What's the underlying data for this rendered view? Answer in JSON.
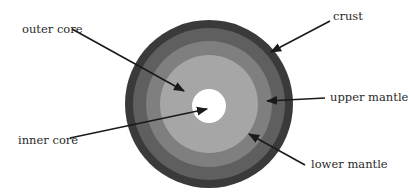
{
  "diagram": {
    "type": "concentric-layers",
    "center": [
      209,
      104
    ],
    "layers": [
      {
        "name": "crust",
        "outer_radius": 84,
        "color": "#3a3a3a"
      },
      {
        "name": "upper mantle",
        "outer_radius": 76,
        "color": "#5f5f5f"
      },
      {
        "name": "lower mantle",
        "outer_radius": 63,
        "color": "#7f7f7f"
      },
      {
        "name": "outer core",
        "outer_radius": 49,
        "color": "#a6a6a6"
      },
      {
        "name": "inner core",
        "outer_radius": 17,
        "color": "#ffffff"
      }
    ]
  },
  "labels": {
    "outer_core": "outer core",
    "inner_core": "inner core",
    "crust": "crust",
    "upper_mantle": "upper mantle",
    "lower_mantle": "lower mantle"
  },
  "arrows": [
    {
      "label": "outer core",
      "from": [
        72,
        29
      ],
      "to": [
        184,
        91
      ]
    },
    {
      "label": "inner core",
      "from": [
        70,
        138
      ],
      "to": [
        207,
        109
      ]
    },
    {
      "label": "crust",
      "from": [
        330,
        21
      ],
      "to": [
        271,
        52
      ]
    },
    {
      "label": "upper mantle",
      "from": [
        325,
        98
      ],
      "to": [
        267,
        101
      ]
    },
    {
      "label": "lower mantle",
      "from": [
        305,
        165
      ],
      "to": [
        249,
        134
      ]
    }
  ]
}
